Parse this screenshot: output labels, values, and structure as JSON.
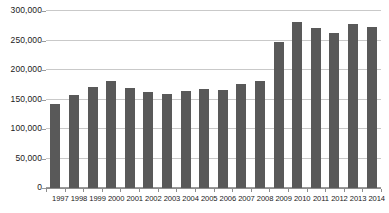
{
  "chart_data": {
    "type": "bar",
    "title": "",
    "xlabel": "",
    "ylabel": "",
    "categories": [
      "1997",
      "1998",
      "1999",
      "2000",
      "2001",
      "2002",
      "2003",
      "2004",
      "2005",
      "2006",
      "2007",
      "2008",
      "2009",
      "2010",
      "2011",
      "2012",
      "2013",
      "2014"
    ],
    "values": [
      143000,
      157000,
      172000,
      181000,
      170000,
      163000,
      160000,
      164000,
      167000,
      166000,
      176000,
      182000,
      248000,
      282000,
      272000,
      263000,
      278000,
      273000
    ],
    "ylim": [
      0,
      300000
    ],
    "ytick_values": [
      0,
      50000,
      100000,
      150000,
      200000,
      250000,
      300000
    ],
    "ytick_labels": [
      "0",
      "50,000",
      "100,000",
      "150,000",
      "200,000",
      "250,000",
      "300,000"
    ],
    "grid": true,
    "legend": null,
    "series": [
      {
        "name": "",
        "color": "#595959",
        "values": [
          143000,
          157000,
          172000,
          181000,
          170000,
          163000,
          160000,
          164000,
          167000,
          166000,
          176000,
          182000,
          248000,
          282000,
          272000,
          263000,
          278000,
          273000
        ]
      }
    ]
  },
  "colors": {
    "bar": "#595959",
    "gridline": "#c9c9c9",
    "axis": "#8d8d8d",
    "text": "#1a1a1a",
    "background": "#ffffff"
  }
}
